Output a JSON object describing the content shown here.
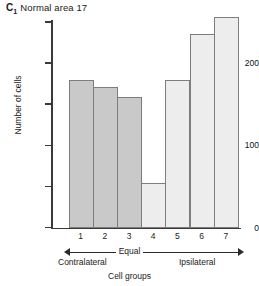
{
  "title": {
    "panel_letter": "C",
    "panel_subscript": "1",
    "text": "Normal area 17"
  },
  "annotations": {
    "equal": "Equal",
    "contralateral": "Contralateral",
    "ipsilateral": "Ipsilateral"
  },
  "colors": {
    "bar_dark": "#c9c9c9",
    "bar_light": "#ededed",
    "bar_border": "#7d7d7d",
    "axis": "#3a3a3a",
    "text": "#1a1a1a"
  },
  "chart_data": {
    "type": "bar",
    "xlabel": "Cell groups",
    "ylabel": "Number of cells",
    "categories": [
      "1",
      "2",
      "3",
      "4",
      "5",
      "6",
      "7"
    ],
    "values": [
      180,
      171,
      159,
      54,
      179,
      235,
      256
    ],
    "bar_fills": [
      "#c9c9c9",
      "#c9c9c9",
      "#c9c9c9",
      "#ededed",
      "#ededed",
      "#ededed",
      "#ededed"
    ],
    "ylim": [
      0,
      258
    ],
    "yticks": [
      0,
      50,
      100,
      150,
      200,
      250
    ],
    "ytick_labels": [
      "0",
      "",
      "100",
      "",
      "200",
      ""
    ],
    "grid": false,
    "legend": null,
    "annotations": [
      {
        "text": "Contralateral",
        "position": "below-left"
      },
      {
        "text": "Equal",
        "position": "below-center"
      },
      {
        "text": "Ipsilateral",
        "position": "below-right"
      }
    ]
  }
}
